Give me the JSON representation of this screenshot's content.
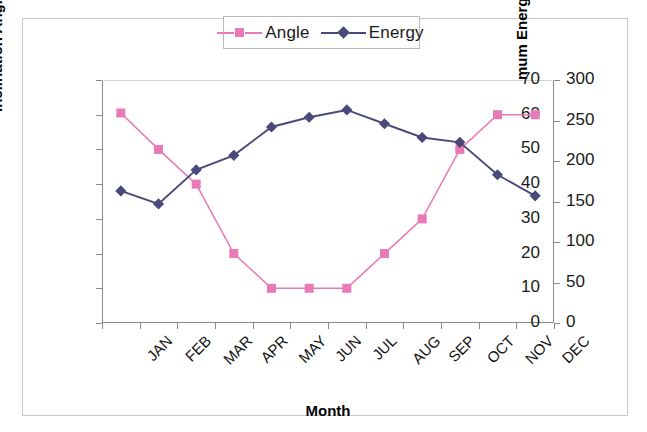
{
  "legend": {
    "position": "top-center",
    "items": [
      {
        "label": "Angle",
        "color": "#e87ab8",
        "marker": "square-marker"
      },
      {
        "label": "Energy",
        "color": "#4a4a7a",
        "marker": "diamond-marker"
      }
    ]
  },
  "axes": {
    "x": {
      "title": "Month"
    },
    "y_left": {
      "title": "Inclination Angle",
      "min": 0,
      "max": 70,
      "step": 10,
      "ticks": [
        "0",
        "10",
        "20",
        "30",
        "40",
        "50",
        "60",
        "70"
      ]
    },
    "y_right": {
      "title_text": "Optimum Energy kWh/m",
      "title_sup": "2",
      "min": 0,
      "max": 300,
      "step": 50,
      "ticks": [
        "0",
        "50",
        "100",
        "150",
        "200",
        "250",
        "300"
      ]
    }
  },
  "chart_data": {
    "type": "line",
    "title": "",
    "xlabel": "Month",
    "ylabel": "Inclination Angle",
    "y2label": "Optimum Energy kWh/m2",
    "grid": false,
    "legend_position": "top-center",
    "ylim": [
      0,
      70
    ],
    "y2lim": [
      0,
      300
    ],
    "categories": [
      "JAN",
      "FEB",
      "MAR",
      "APR",
      "MAY",
      "JUN",
      "JUL",
      "AUG",
      "SEP",
      "OCT",
      "NOV",
      "DEC"
    ],
    "series": [
      {
        "name": "Angle",
        "axis": "left",
        "color": "#e87ab8",
        "marker": "square",
        "values": [
          60.5,
          50,
          40,
          20,
          10,
          10,
          10,
          20,
          30,
          50,
          60,
          60
        ]
      },
      {
        "name": "Energy",
        "axis": "right",
        "color": "#4a4a7a",
        "marker": "diamond",
        "values": [
          163,
          147,
          189,
          207,
          242,
          254,
          263,
          246,
          229,
          223,
          183,
          157
        ]
      }
    ]
  }
}
